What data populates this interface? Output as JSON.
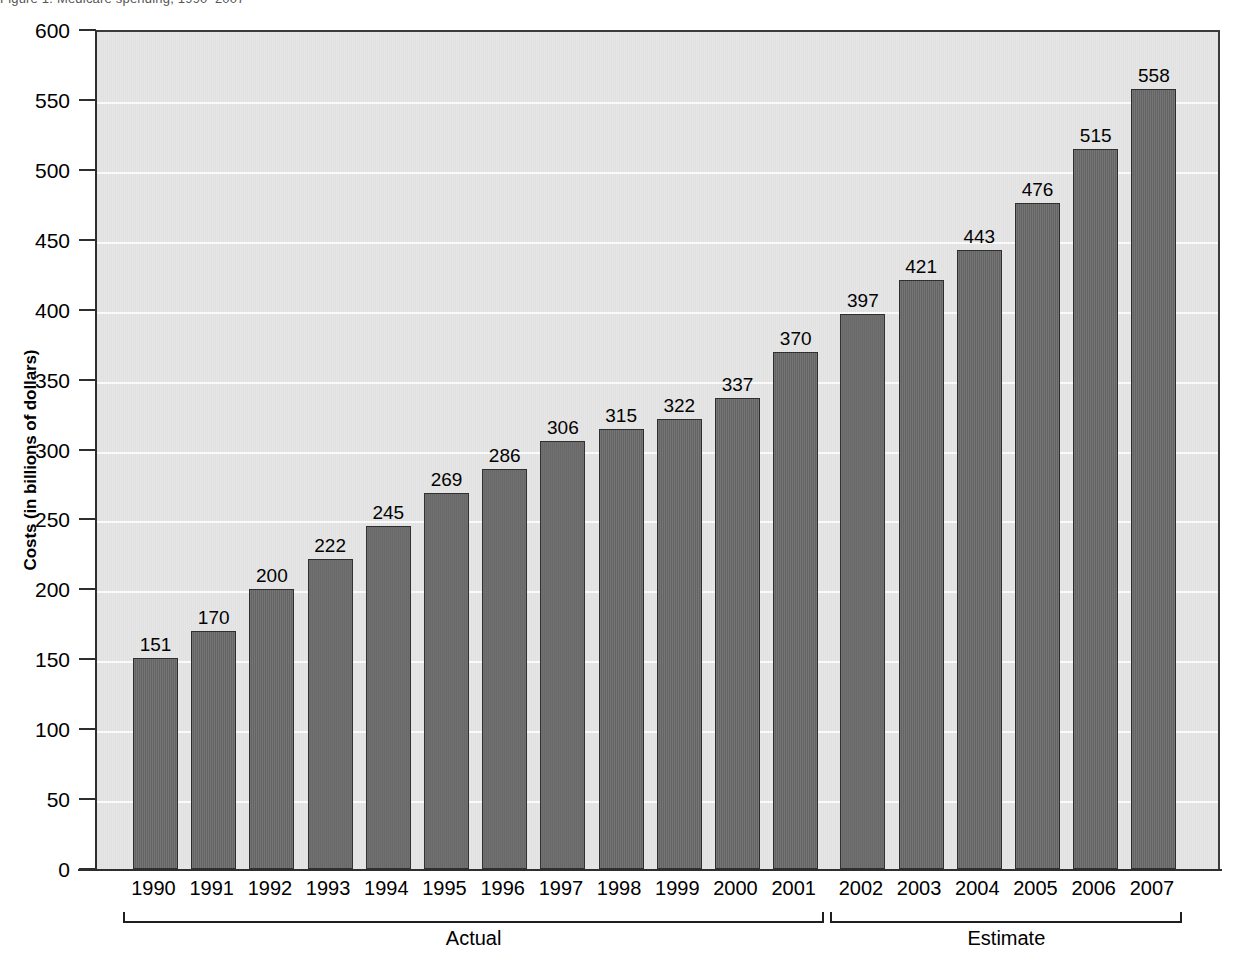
{
  "figure": {
    "caption_fragment": "Figure 1. Medicare spending, 1990–2007",
    "background_color": "#e6e6e6",
    "bar_color": "#6b6b6b",
    "bar_border_color": "#2e2e2e",
    "gridline_color": "#fdfdfd",
    "axis_color": "#2e2e2e"
  },
  "chart_data": {
    "type": "bar",
    "title": "",
    "xlabel": "",
    "ylabel": "Costs (in billions of dollars)",
    "ylim": [
      0,
      600
    ],
    "yticks": [
      0,
      50,
      100,
      150,
      200,
      250,
      300,
      350,
      400,
      450,
      500,
      550,
      600
    ],
    "ytick_labels": [
      "0",
      "50",
      "100",
      "150",
      "200",
      "250",
      "300",
      "350",
      "400",
      "450",
      "500",
      "550",
      "600"
    ],
    "grid": true,
    "grid_axis": "y",
    "legend": false,
    "categories": [
      "1990",
      "1991",
      "1992",
      "1993",
      "1994",
      "1995",
      "1996",
      "1997",
      "1998",
      "1999",
      "2000",
      "2001",
      "2002",
      "2003",
      "2004",
      "2005",
      "2006",
      "2007"
    ],
    "values": [
      151,
      170,
      200,
      222,
      245,
      269,
      286,
      306,
      315,
      322,
      337,
      370,
      397,
      421,
      443,
      476,
      515,
      558
    ],
    "value_labels": [
      "151",
      "170",
      "200",
      "222",
      "245",
      "269",
      "286",
      "306",
      "315",
      "322",
      "337",
      "370",
      "397",
      "421",
      "443",
      "476",
      "515",
      "558"
    ],
    "groups": [
      {
        "label": "Actual",
        "start_index": 0,
        "end_index": 11
      },
      {
        "label": "Estimate",
        "start_index": 12,
        "end_index": 17
      }
    ]
  }
}
